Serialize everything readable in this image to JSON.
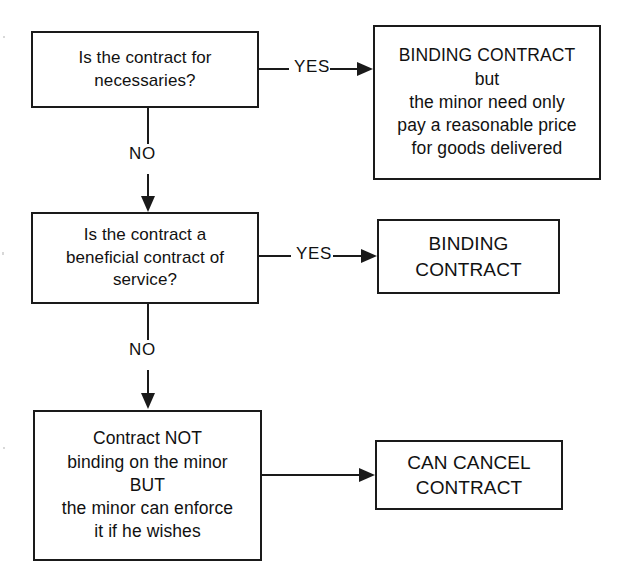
{
  "diagram": {
    "background_color": "#ffffff",
    "line_color": "#1a1a1a",
    "text_color": "#111111"
  },
  "nodes": {
    "question_necessaries": {
      "text": "Is the contract for\nnecessaries?",
      "shape": "rectangle"
    },
    "outcome_necessaries": {
      "text": "BINDING CONTRACT\nbut\nthe minor need only\npay a reasonable price\nfor goods delivered",
      "shape": "rectangle"
    },
    "question_beneficial_service": {
      "text": "Is the contract a\nbeneficial contract of\nservice?",
      "shape": "rectangle"
    },
    "outcome_binding": {
      "text": "BINDING\nCONTRACT",
      "shape": "rectangle"
    },
    "outcome_not_binding": {
      "text": "Contract NOT\nbinding on the minor\nBUT\nthe minor can enforce\nit if he wishes",
      "shape": "rectangle"
    },
    "outcome_can_cancel": {
      "text": "CAN CANCEL\nCONTRACT",
      "shape": "rectangle"
    }
  },
  "edges": {
    "yes_necessaries": {
      "label": "YES"
    },
    "no_necessaries": {
      "label": "NO"
    },
    "yes_beneficial": {
      "label": "YES"
    },
    "no_beneficial": {
      "label": "NO"
    },
    "to_can_cancel": {
      "label": ""
    }
  }
}
